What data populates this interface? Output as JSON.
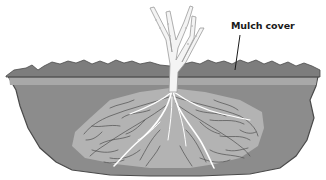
{
  "diagram": {
    "labels": [
      {
        "id": "mulch",
        "text": "Mulch cover",
        "x": 231,
        "y": 20
      }
    ],
    "colors": {
      "background": "#ffffff",
      "soil": "#8c8c8c",
      "soil_outline": "#4a4a4a",
      "root_zone": "#b3b3b3",
      "mulch": "#7d7d7d",
      "mulch_band": "#a8a8a8",
      "mulch_line": "#555555",
      "stem": "#f4f4f4",
      "stem_outline": "#9a9a9a",
      "fine_roots": "#4f4f4f",
      "main_roots": "#ffffff",
      "leader_line": "#1a1a1a"
    }
  }
}
